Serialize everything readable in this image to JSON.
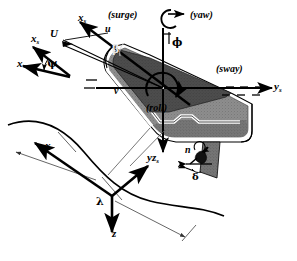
{
  "figure": {
    "background_color": "#ffffff",
    "ink_color": "#000000",
    "hull_colors": {
      "deck_interior": "#4a4a4a",
      "hull_body": "#8d8d8d",
      "hull_shadow": "#6e6e6e",
      "gunwale": "#ffffff",
      "rudder": "#707070"
    }
  },
  "labels": {
    "surge": "(surge)",
    "sway": "(sway)",
    "yaw": "(yaw)",
    "roll": "(roll)"
  },
  "axes": {
    "body_x": {
      "symbol": "x",
      "sub": "s"
    },
    "body_y": {
      "symbol": "y",
      "sub": "s"
    },
    "body_z": {
      "symbol": "z",
      "sub": "s"
    },
    "earth_x": {
      "symbol": "x",
      "sub": ""
    },
    "earth_y": {
      "symbol": "y",
      "sub": ""
    },
    "earth_z": {
      "symbol": "z",
      "sub": ""
    },
    "heading_ref_x": {
      "symbol": "x",
      "sub": "s"
    },
    "heading_x": {
      "symbol": "x",
      "sub": ""
    }
  },
  "velocities": {
    "total": "U",
    "surge_component": "u",
    "sway_component": "v"
  },
  "greek": {
    "drift_angle": "β",
    "roll_angle": "ϕ",
    "heading_angle": "ψ",
    "rudder_angle": "δ",
    "wavelength": "λ"
  },
  "propulsion": {
    "shaft_speed": "n"
  }
}
